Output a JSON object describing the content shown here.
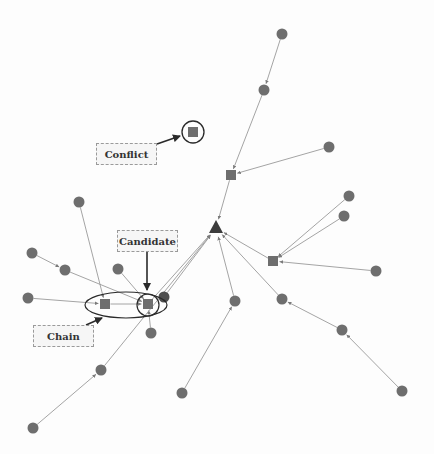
{
  "diagram": {
    "type": "directed-tree-graph",
    "colors": {
      "node": "#6e6e6e",
      "node_dark": "#4f4f4f",
      "edge": "#9a9a9a",
      "annotation": "#2a2a2a",
      "label_bg": "#f6f6f6",
      "label_border": "#9a9a9a"
    },
    "labels": {
      "conflict": "Conflict",
      "candidate": "Candidate",
      "chain": "Chain"
    },
    "root": {
      "id": "root",
      "shape": "triangle",
      "x": 216,
      "y": 228
    },
    "nodes": [
      {
        "id": "n1",
        "shape": "circle",
        "x": 282,
        "y": 34
      },
      {
        "id": "n2",
        "shape": "circle",
        "x": 264,
        "y": 90
      },
      {
        "id": "s1",
        "shape": "square",
        "x": 231,
        "y": 175
      },
      {
        "id": "n3",
        "shape": "circle",
        "x": 329,
        "y": 147
      },
      {
        "id": "s2",
        "shape": "square",
        "x": 273,
        "y": 261
      },
      {
        "id": "n4",
        "shape": "circle",
        "x": 349,
        "y": 196
      },
      {
        "id": "n5",
        "shape": "circle",
        "x": 344,
        "y": 216
      },
      {
        "id": "n6",
        "shape": "circle",
        "x": 376,
        "y": 271
      },
      {
        "id": "n7",
        "shape": "circle",
        "x": 235,
        "y": 301
      },
      {
        "id": "n8",
        "shape": "circle",
        "x": 282,
        "y": 299
      },
      {
        "id": "n9",
        "shape": "circle",
        "x": 342,
        "y": 330
      },
      {
        "id": "n10",
        "shape": "circle",
        "x": 402,
        "y": 391
      },
      {
        "id": "n11",
        "shape": "circle",
        "x": 182,
        "y": 393
      },
      {
        "id": "conflict",
        "shape": "square",
        "x": 193,
        "y": 132,
        "highlight": "circle"
      },
      {
        "id": "chainsq",
        "shape": "square",
        "x": 105,
        "y": 304
      },
      {
        "id": "cand",
        "shape": "square",
        "x": 148,
        "y": 304,
        "highlight": "circle"
      },
      {
        "id": "n12",
        "shape": "circle",
        "x": 164,
        "y": 297,
        "dark": true
      },
      {
        "id": "n13",
        "shape": "circle",
        "x": 32,
        "y": 253
      },
      {
        "id": "n14",
        "shape": "circle",
        "x": 65,
        "y": 270
      },
      {
        "id": "n15",
        "shape": "circle",
        "x": 28,
        "y": 298
      },
      {
        "id": "n16",
        "shape": "circle",
        "x": 79,
        "y": 202
      },
      {
        "id": "n17",
        "shape": "circle",
        "x": 118,
        "y": 269
      },
      {
        "id": "n18",
        "shape": "circle",
        "x": 151,
        "y": 333
      },
      {
        "id": "n19",
        "shape": "circle",
        "x": 101,
        "y": 370
      },
      {
        "id": "n20",
        "shape": "circle",
        "x": 33,
        "y": 428
      }
    ],
    "edges": [
      [
        "n1",
        "n2"
      ],
      [
        "n2",
        "s1"
      ],
      [
        "n3",
        "s1"
      ],
      [
        "s1",
        "root"
      ],
      [
        "n4",
        "s2"
      ],
      [
        "n5",
        "s2"
      ],
      [
        "n6",
        "s2"
      ],
      [
        "s2",
        "root"
      ],
      [
        "n7",
        "root"
      ],
      [
        "n8",
        "root"
      ],
      [
        "n9",
        "n8"
      ],
      [
        "n10",
        "n9"
      ],
      [
        "n11",
        "n7"
      ],
      [
        "n13",
        "n14"
      ],
      [
        "n14",
        "cand"
      ],
      [
        "n15",
        "chainsq"
      ],
      [
        "n16",
        "chainsq"
      ],
      [
        "chainsq",
        "cand"
      ],
      [
        "n17",
        "cand"
      ],
      [
        "cand",
        "root"
      ],
      [
        "n12",
        "root"
      ],
      [
        "n18",
        "cand"
      ],
      [
        "n20",
        "n19"
      ],
      [
        "n19",
        "root"
      ]
    ]
  }
}
